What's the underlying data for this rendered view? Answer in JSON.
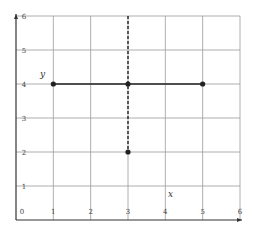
{
  "chart_data": {
    "type": "line",
    "title": "",
    "xlabel": "x",
    "ylabel": "y",
    "xlim": [
      0,
      6
    ],
    "ylim": [
      0,
      6
    ],
    "grid": true,
    "x_ticks": [
      "0",
      "1",
      "2",
      "3",
      "4",
      "5",
      "6"
    ],
    "y_ticks": [
      "1",
      "2",
      "3",
      "4",
      "5",
      "6"
    ],
    "series": [
      {
        "name": "horizontal segment",
        "style": "solid",
        "points": [
          [
            1,
            4
          ],
          [
            3,
            4
          ],
          [
            5,
            4
          ]
        ]
      },
      {
        "name": "vertical segment",
        "style": "dashed",
        "points": [
          [
            3,
            6
          ],
          [
            3,
            4
          ],
          [
            3,
            2
          ]
        ]
      }
    ],
    "marked_points": [
      [
        1,
        4
      ],
      [
        3,
        4
      ],
      [
        5,
        4
      ],
      [
        3,
        2
      ]
    ],
    "colors": {
      "grid": "#9a9a9a",
      "axis": "#333333",
      "line": "#222222"
    }
  }
}
